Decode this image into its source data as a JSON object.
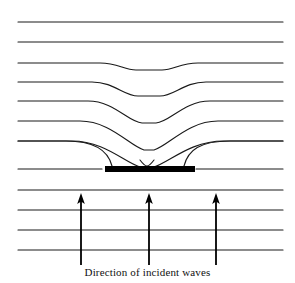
{
  "figure": {
    "caption": "Direction of incident waves",
    "width": 295,
    "height": 283,
    "background_color": "#ffffff",
    "line_color": "#1a1a1a",
    "bar_color": "#000000",
    "arrow_color": "#000000"
  },
  "diagram": {
    "type": "wavefront-refraction",
    "obstacle": {
      "name": "bar",
      "x": 105,
      "y": 166,
      "width": 90,
      "height": 6,
      "color": "#000000"
    },
    "incident_wavefronts": [
      {
        "index": 0,
        "y": 190,
        "shape": "straight"
      },
      {
        "index": 1,
        "y": 210,
        "shape": "straight"
      },
      {
        "index": 2,
        "y": 230,
        "shape": "straight"
      },
      {
        "index": 3,
        "y": 250,
        "shape": "straight"
      }
    ],
    "bar_level_wavefront": {
      "index": 4,
      "y": 168,
      "shape": "split-by-bar"
    },
    "refracted_wavefronts": [
      {
        "index": 5,
        "y": 143,
        "dip_depth": 30,
        "dip_width": 72,
        "shape": "deep-cusp"
      },
      {
        "index": 6,
        "y": 123,
        "dip_depth": 26,
        "dip_width": 86,
        "shape": "deep-v"
      },
      {
        "index": 7,
        "y": 103,
        "dip_depth": 20,
        "dip_width": 100,
        "shape": "v-dip"
      },
      {
        "index": 8,
        "y": 83,
        "dip_depth": 13,
        "dip_width": 110,
        "shape": "shallow-dip"
      },
      {
        "index": 9,
        "y": 63,
        "dip_depth": 7,
        "dip_width": 96,
        "shape": "very-shallow-dip"
      },
      {
        "index": 10,
        "y": 42,
        "dip_depth": 0,
        "shape": "straight"
      },
      {
        "index": 11,
        "y": 22,
        "dip_depth": 0,
        "shape": "straight"
      }
    ],
    "arrows": [
      {
        "name": "incident-arrow-left",
        "x": 81,
        "y_tail": 265,
        "y_head": 194
      },
      {
        "name": "incident-arrow-center",
        "x": 149,
        "y_tail": 265,
        "y_head": 194
      },
      {
        "name": "incident-arrow-right",
        "x": 216,
        "y_tail": 265,
        "y_head": 194
      }
    ],
    "wavefront_x_start": 18,
    "wavefront_x_end": 283
  }
}
